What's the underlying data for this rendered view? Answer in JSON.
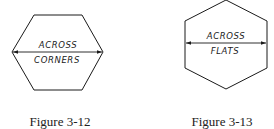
{
  "figures": [
    {
      "caption": "Figure 3-12",
      "label_line1": "ACROSS",
      "label_line2": "CORNERS",
      "dimension": "across corners"
    },
    {
      "caption": "Figure 3-13",
      "label_line1": "ACROSS",
      "label_line2": "FLATS",
      "dimension": "across flats"
    }
  ],
  "colors": {
    "line": "#1a1a1a",
    "background": "#ffffff"
  }
}
